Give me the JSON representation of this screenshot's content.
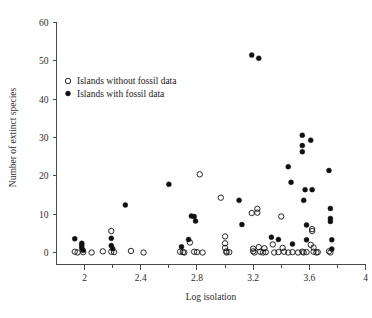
{
  "chart_data": {
    "type": "scatter",
    "title": "",
    "xlabel": "Log isolation",
    "ylabel": "Number of extinct species",
    "xlim": [
      1.8,
      4.0
    ],
    "ylim": [
      -2,
      60
    ],
    "grid": false,
    "legend_position": "upper-left-inside",
    "x_ticks": [
      2,
      2.4,
      2.8,
      3.2,
      3.6,
      4
    ],
    "x_tick_labels": [
      "2",
      "2.4",
      "2.8",
      "3.2",
      "3.6",
      "4"
    ],
    "x_minor_ticks": [
      2.2,
      2.6,
      3.0,
      3.4,
      3.8
    ],
    "y_ticks": [
      0,
      10,
      20,
      30,
      40,
      50,
      60
    ],
    "y_tick_labels": [
      "0",
      "10",
      "20",
      "30",
      "40",
      "50",
      "60"
    ],
    "series": [
      {
        "name": "Islands without fossil data",
        "marker": "open-circle",
        "color": "#111111",
        "points": [
          [
            1.93,
            0.2
          ],
          [
            1.95,
            0.0
          ],
          [
            1.99,
            0.1
          ],
          [
            2.05,
            0.0
          ],
          [
            2.13,
            0.3
          ],
          [
            2.19,
            5.6
          ],
          [
            2.19,
            0.2
          ],
          [
            2.21,
            0.1
          ],
          [
            2.33,
            0.4
          ],
          [
            2.42,
            0.0
          ],
          [
            2.68,
            0.2
          ],
          [
            2.7,
            0.1
          ],
          [
            2.71,
            0.0
          ],
          [
            2.75,
            2.6
          ],
          [
            2.78,
            0.2
          ],
          [
            2.8,
            0.1
          ],
          [
            2.82,
            20.4
          ],
          [
            2.84,
            0.0
          ],
          [
            2.97,
            14.3
          ],
          [
            3.0,
            4.2
          ],
          [
            3.0,
            2.4
          ],
          [
            3.0,
            1.2
          ],
          [
            3.01,
            0.3
          ],
          [
            3.01,
            0.0
          ],
          [
            3.03,
            0.1
          ],
          [
            3.19,
            10.3
          ],
          [
            3.2,
            1.0
          ],
          [
            3.2,
            0.3
          ],
          [
            3.21,
            0.0
          ],
          [
            3.23,
            11.4
          ],
          [
            3.23,
            10.4
          ],
          [
            3.24,
            1.4
          ],
          [
            3.25,
            0.2
          ],
          [
            3.27,
            0.0
          ],
          [
            3.28,
            1.1
          ],
          [
            3.29,
            0.1
          ],
          [
            3.34,
            2.1
          ],
          [
            3.35,
            0.0
          ],
          [
            3.38,
            0.1
          ],
          [
            3.4,
            9.4
          ],
          [
            3.41,
            1.2
          ],
          [
            3.42,
            0.2
          ],
          [
            3.45,
            0.0
          ],
          [
            3.48,
            0.1
          ],
          [
            3.52,
            0.0
          ],
          [
            3.55,
            0.2
          ],
          [
            3.56,
            0.0
          ],
          [
            3.58,
            0.1
          ],
          [
            3.61,
            2.0
          ],
          [
            3.62,
            6.1
          ],
          [
            3.62,
            5.6
          ],
          [
            3.63,
            1.3
          ],
          [
            3.63,
            0.2
          ],
          [
            3.65,
            0.0
          ],
          [
            3.66,
            0.1
          ],
          [
            3.74,
            0.3
          ],
          [
            3.75,
            0.0
          ]
        ]
      },
      {
        "name": "Islands with fossil data",
        "marker": "filled-circle",
        "color": "#111111",
        "points": [
          [
            1.93,
            3.6
          ],
          [
            1.98,
            2.4
          ],
          [
            1.98,
            1.8
          ],
          [
            1.98,
            1.2
          ],
          [
            1.99,
            0.6
          ],
          [
            2.19,
            3.7
          ],
          [
            2.19,
            1.8
          ],
          [
            2.2,
            1.0
          ],
          [
            2.29,
            12.4
          ],
          [
            2.6,
            17.8
          ],
          [
            2.69,
            1.5
          ],
          [
            2.74,
            3.4
          ],
          [
            2.76,
            9.5
          ],
          [
            2.78,
            9.4
          ],
          [
            2.79,
            8.2
          ],
          [
            3.1,
            13.6
          ],
          [
            3.12,
            7.3
          ],
          [
            3.19,
            51.5
          ],
          [
            3.24,
            50.7
          ],
          [
            3.33,
            4.0
          ],
          [
            3.38,
            3.4
          ],
          [
            3.45,
            22.4
          ],
          [
            3.47,
            18.3
          ],
          [
            3.48,
            2.2
          ],
          [
            3.55,
            30.6
          ],
          [
            3.55,
            27.9
          ],
          [
            3.55,
            26.3
          ],
          [
            3.56,
            13.6
          ],
          [
            3.57,
            16.4
          ],
          [
            3.58,
            7.2
          ],
          [
            3.58,
            3.3
          ],
          [
            3.61,
            29.3
          ],
          [
            3.62,
            16.4
          ],
          [
            3.74,
            21.4
          ],
          [
            3.75,
            11.5
          ],
          [
            3.75,
            8.9
          ],
          [
            3.75,
            8.1
          ],
          [
            3.76,
            3.3
          ],
          [
            3.76,
            0.9
          ]
        ]
      }
    ]
  },
  "legend": {
    "entries": [
      {
        "label": "Islands without fossil data",
        "marker": "open-circle"
      },
      {
        "label": "Islands with fossil data",
        "marker": "filled-circle"
      }
    ]
  }
}
